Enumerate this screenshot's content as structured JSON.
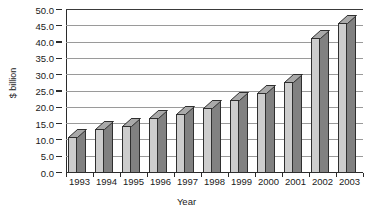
{
  "chart_data": {
    "type": "bar",
    "title": "",
    "subtitle": "",
    "xlabel": "Year",
    "ylabel": "$ billion",
    "categories": [
      "1993",
      "1994",
      "1995",
      "1996",
      "1997",
      "1998",
      "1999",
      "2000",
      "2001",
      "2002",
      "2003"
    ],
    "values": [
      11.0,
      13.5,
      14.5,
      17.0,
      18.0,
      20.0,
      22.5,
      24.5,
      28.0,
      41.5,
      46.0
    ],
    "ylim": [
      0,
      50
    ],
    "ytick_step": 5,
    "ytick_labels": [
      "0.0",
      "5.0",
      "10.0",
      "15.0",
      "20.0",
      "25.0",
      "30.0",
      "35.0",
      "40.0",
      "45.0",
      "50.0"
    ],
    "ytick_values": [
      0,
      5,
      10,
      15,
      20,
      25,
      30,
      35,
      40,
      45,
      50
    ],
    "grid": true,
    "grid_axis": "y",
    "legend": false,
    "legend_position": "none",
    "style": "3d-bar",
    "series": [
      {
        "name": "$ billion",
        "values": [
          11.0,
          13.5,
          14.5,
          17.0,
          18.0,
          20.0,
          22.5,
          24.5,
          28.0,
          41.5,
          46.0
        ]
      }
    ],
    "annotations": []
  },
  "colors": {
    "bar_front": "#cdcdcd",
    "bar_side": "#818181",
    "bar_top": "#a9a9a9",
    "bar_outline": "#2f2f2f",
    "gridline": "#9a9a9a",
    "axis": "#2b2b2b",
    "background": "#ffffff",
    "text": "#1a1a1a"
  }
}
